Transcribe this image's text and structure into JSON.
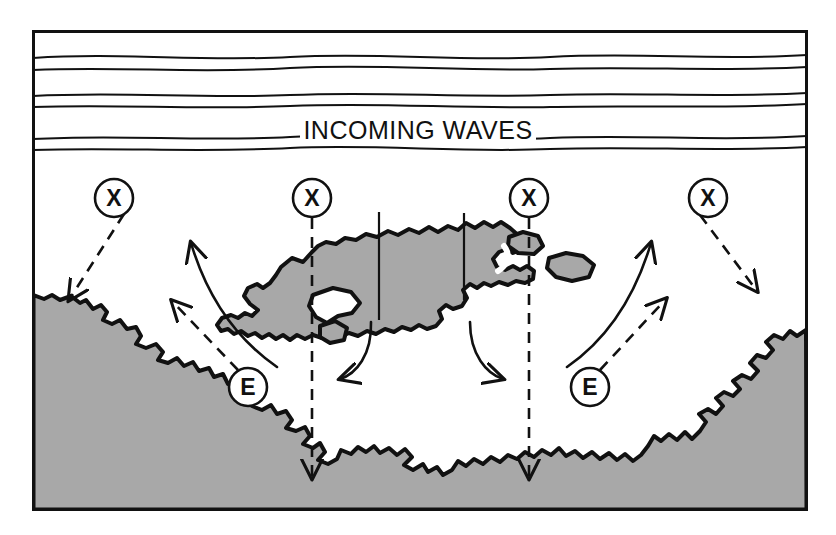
{
  "figure": {
    "title_text": "INCOMING WAVES",
    "kind": "coastal-process-diagram",
    "frame": {
      "x": 32,
      "y": 30,
      "width": 776,
      "height": 481,
      "stroke": "#111111",
      "stroke_width": 3
    },
    "colors": {
      "land_fill": "#a8a8a8",
      "water_fill": "#ffffff",
      "ink": "#111111",
      "background": "#ffffff"
    }
  },
  "wave_lines": {
    "count": 6,
    "label": "INCOMING WAVES",
    "label_x": 418,
    "label_y": 130,
    "rows": [
      {
        "name": "wave-crest-1",
        "y": 57
      },
      {
        "name": "wave-crest-2",
        "y": 68
      },
      {
        "name": "wave-crest-3",
        "y": 95
      },
      {
        "name": "wave-crest-4",
        "y": 105
      },
      {
        "name": "wave-crest-5",
        "y": 138
      },
      {
        "name": "wave-crest-6",
        "y": 148
      }
    ]
  },
  "nodes": [
    {
      "id": "x-left-outer",
      "letter": "X",
      "cx": 114,
      "cy": 198,
      "r": 19
    },
    {
      "id": "x-left-inner",
      "letter": "X",
      "cx": 312,
      "cy": 198,
      "r": 19
    },
    {
      "id": "x-right-inner",
      "letter": "X",
      "cx": 529,
      "cy": 198,
      "r": 19
    },
    {
      "id": "x-right-outer",
      "letter": "X",
      "cx": 708,
      "cy": 198,
      "r": 19
    },
    {
      "id": "e-left",
      "letter": "E",
      "cx": 248,
      "cy": 387,
      "r": 19
    },
    {
      "id": "e-right",
      "letter": "E",
      "cx": 590,
      "cy": 387,
      "r": 19
    }
  ],
  "dashed_rays": [
    {
      "id": "ray-x-left-outer",
      "from": "x-left-outer",
      "to_x": 68,
      "to_y": 302,
      "style": "dashed-arrow"
    },
    {
      "id": "ray-x-left-inner",
      "from": "x-left-inner",
      "to_x": 312,
      "to_y": 478,
      "style": "dashed-arrow"
    },
    {
      "id": "ray-x-right-inner",
      "from": "x-right-inner",
      "to_x": 529,
      "to_y": 478,
      "style": "dashed-arrow"
    },
    {
      "id": "ray-x-right-outer",
      "from": "x-right-outer",
      "to_x": 758,
      "to_y": 292,
      "style": "dashed-arrow"
    },
    {
      "id": "ray-e-left",
      "from": "e-left",
      "to_x": 170,
      "to_y": 300,
      "style": "dashed-arrow"
    },
    {
      "id": "ray-e-right",
      "from": "e-right",
      "to_x": 668,
      "to_y": 298,
      "style": "dashed-arrow"
    }
  ],
  "current_arrows": [
    {
      "id": "current-left-up",
      "direction": "up-left",
      "note": "longshore current toward left shore"
    },
    {
      "id": "current-left-in",
      "direction": "left",
      "note": "current flowing left from behind reef"
    },
    {
      "id": "current-right-in",
      "direction": "right",
      "note": "current flowing right from behind reef"
    },
    {
      "id": "current-right-up",
      "direction": "up-right",
      "note": "longshore current toward right shore"
    }
  ],
  "features": [
    {
      "id": "offshore-reef",
      "name": "offshore reef / breakwater",
      "fill": "#a8a8a8"
    },
    {
      "id": "reef-islet-a",
      "name": "reef islet",
      "fill": "#a8a8a8"
    },
    {
      "id": "reef-islet-b",
      "name": "reef islet",
      "fill": "#a8a8a8"
    },
    {
      "id": "shoreline-land",
      "name": "shoreline land mass",
      "fill": "#a8a8a8"
    }
  ],
  "tick_marks": [
    {
      "id": "reef-tick-left",
      "x": 379,
      "y1": 212,
      "y2": 320
    },
    {
      "id": "reef-tick-right",
      "x": 464,
      "y1": 213,
      "y2": 300
    }
  ]
}
